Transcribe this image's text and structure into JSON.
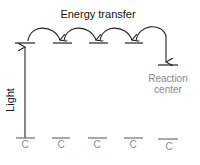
{
  "diagram": {
    "title": "Energy transfer",
    "side_label": "Light",
    "reaction_label_line1": "Reaction",
    "reaction_label_line2": "center",
    "ground_labels": [
      "C",
      "C",
      "C",
      "C",
      "C"
    ],
    "colors": {
      "line": "#222222",
      "text": "#111111",
      "muted_text": "#888888",
      "ground_line": "#555555"
    }
  }
}
